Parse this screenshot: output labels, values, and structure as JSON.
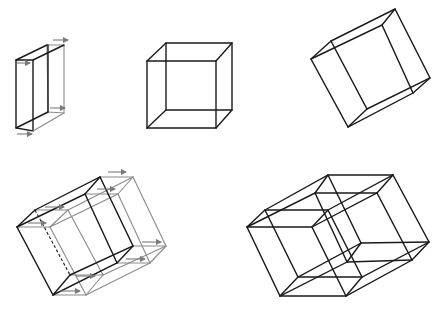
{
  "figure": {
    "colors": {
      "primary_stroke": "#1a1a1a",
      "trace_stroke": "#8a8a8a",
      "arrow": "#7a7a7a",
      "background": "#ffffff"
    },
    "panels": [
      {
        "id": "slab-translation",
        "label": "Square translated into a prism (with motion arrows)"
      },
      {
        "id": "cube-front",
        "label": "Cube (front view)"
      },
      {
        "id": "cube-rotated",
        "label": "Cube (rotated)"
      },
      {
        "id": "cube-translation",
        "label": "Rotated cube translated (with motion arrows)"
      },
      {
        "id": "tesseract",
        "label": "Tesseract projection"
      }
    ]
  }
}
